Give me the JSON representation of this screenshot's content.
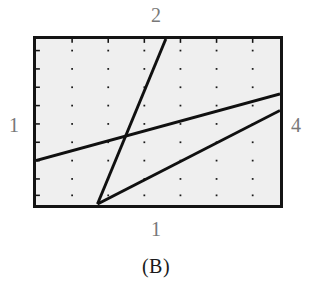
{
  "caption": "(B)",
  "axes": {
    "top_label": "2",
    "bottom_label": "1",
    "left_label": "1",
    "right_label": "4"
  },
  "colors": {
    "plot_background": "#efefef",
    "frame": "#141414",
    "line": "#101010",
    "grid_dot": "#1a1a1a",
    "label": "#787878",
    "caption": "#1a1a1a",
    "page_background": "#ffffff"
  },
  "chart_data": {
    "type": "line",
    "title": "(B)",
    "xlabel": "1",
    "ylabel": "1",
    "top_label": "2",
    "right_label": "4",
    "xlim": [
      0,
      250
    ],
    "ylim": [
      0,
      172
    ],
    "grid": true,
    "grid_style": "dotted-vertical",
    "grid_x": [
      37,
      74,
      111,
      148,
      185,
      222
    ],
    "grid_dot_rows": [
      12,
      31,
      50,
      69,
      88,
      107,
      126,
      145,
      162
    ],
    "legend": "none",
    "series": [
      {
        "name": "steep-line-2",
        "points": [
          [
            63,
            171
          ],
          [
            133,
            0
          ]
        ],
        "slope_description": "steep rising, exits top edge"
      },
      {
        "name": "upper-line-1-4",
        "points": [
          [
            0,
            126
          ],
          [
            250,
            57
          ]
        ],
        "slope_description": "gentle rising, spans left edge to right edge"
      },
      {
        "name": "lower-line",
        "points": [
          [
            63,
            171
          ],
          [
            250,
            74
          ]
        ],
        "slope_description": "moderate rising from bottom origin to right edge"
      }
    ]
  }
}
